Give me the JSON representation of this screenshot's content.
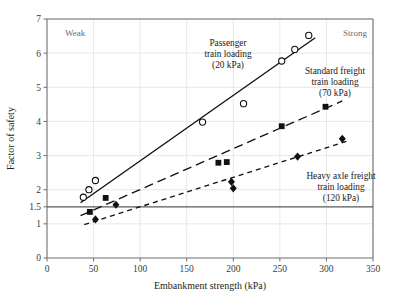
{
  "chart_data": {
    "type": "scatter",
    "title": "",
    "xlabel": "Embankment strength (kPa)",
    "ylabel": "Factor of safety",
    "xlim": [
      0,
      350
    ],
    "ylim": [
      0,
      7
    ],
    "xticks": [
      0,
      50,
      100,
      150,
      200,
      250,
      300,
      350
    ],
    "xticklabels": [
      "0",
      "50",
      "100",
      "150",
      "200",
      "250",
      "300",
      "350"
    ],
    "yticks": [
      0,
      1,
      1.5,
      2,
      3,
      4,
      5,
      6,
      7
    ],
    "yticklabels": [
      "0",
      "1",
      "1.5",
      "2",
      "3",
      "4",
      "5",
      "6",
      "7"
    ],
    "grid": true,
    "legend_position": "inline-annotations",
    "reference_line": {
      "axis": "y",
      "value": 1.5,
      "style": "solid",
      "label": "1.5"
    },
    "corner_labels": {
      "left": "Weak",
      "right": "Strong"
    },
    "series": [
      {
        "name": "Passenger train loading (20 kPa)",
        "annotation": [
          "Passenger",
          "train loading",
          "(20 kPa)"
        ],
        "marker": "open-circle",
        "line_style": "solid",
        "points": [
          {
            "x": 39,
            "y": 1.78
          },
          {
            "x": 45,
            "y": 2.0
          },
          {
            "x": 52,
            "y": 2.27
          },
          {
            "x": 167,
            "y": 3.98
          },
          {
            "x": 211,
            "y": 4.52
          },
          {
            "x": 252,
            "y": 5.77
          },
          {
            "x": 266,
            "y": 6.11
          },
          {
            "x": 281,
            "y": 6.52
          }
        ],
        "fit_line": {
          "x0": 36,
          "y0": 1.62,
          "x1": 288,
          "y1": 6.45
        }
      },
      {
        "name": "Standard freight train loading (70 kPa)",
        "annotation": [
          "Standard freight",
          "train loading",
          "(70 kPa)"
        ],
        "marker": "filled-square",
        "line_style": "long-dash",
        "points": [
          {
            "x": 46,
            "y": 1.35
          },
          {
            "x": 63,
            "y": 1.76
          },
          {
            "x": 184,
            "y": 2.79
          },
          {
            "x": 193,
            "y": 2.81
          },
          {
            "x": 252,
            "y": 3.86
          },
          {
            "x": 299,
            "y": 4.43
          }
        ],
        "fit_line": {
          "x0": 36,
          "y0": 1.24,
          "x1": 317,
          "y1": 4.6
        }
      },
      {
        "name": "Heavy axle freight train loading (120 kPa)",
        "annotation": [
          "Heavy axle freight",
          "train loading",
          "(120 kPa)"
        ],
        "marker": "filled-diamond",
        "line_style": "short-dash",
        "points": [
          {
            "x": 52,
            "y": 1.13
          },
          {
            "x": 74,
            "y": 1.56
          },
          {
            "x": 198,
            "y": 2.23
          },
          {
            "x": 200,
            "y": 2.04
          },
          {
            "x": 269,
            "y": 2.97
          },
          {
            "x": 317,
            "y": 3.49
          }
        ],
        "fit_line": {
          "x0": 40,
          "y0": 0.98,
          "x1": 322,
          "y1": 3.42
        }
      }
    ],
    "colors": {
      "axis": "#6f6f6f",
      "grid": "#dcdcdc",
      "marker": "#111111",
      "line": "#111111",
      "text": "#231f20",
      "corner_text": "#6b6b6b",
      "reference_line": "#585858"
    }
  }
}
